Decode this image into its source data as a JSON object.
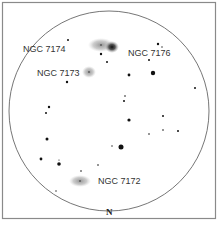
{
  "finder_chart": {
    "orientation_label": "N",
    "galaxies": [
      {
        "name": "NGC 7174",
        "label_x": 23,
        "label_y": 52,
        "shape": {
          "cx": 101,
          "cy": 45,
          "rx": 13,
          "ry": 7
        }
      },
      {
        "name": "NGC 7176",
        "label_x": 128,
        "label_y": 56,
        "shape": {
          "cx": 112,
          "cy": 47,
          "rx": 7,
          "ry": 6
        }
      },
      {
        "name": "NGC 7173",
        "label_x": 37,
        "label_y": 76,
        "shape": {
          "cx": 89,
          "cy": 72,
          "rx": 7,
          "ry": 6
        }
      },
      {
        "name": "NGC 7172",
        "label_x": 98,
        "label_y": 184,
        "shape": {
          "cx": 80,
          "cy": 181,
          "rx": 11,
          "ry": 6
        }
      }
    ],
    "stars": [
      {
        "x": 68,
        "y": 40,
        "r": 1
      },
      {
        "x": 101,
        "y": 54,
        "r": 1.2
      },
      {
        "x": 107,
        "y": 62,
        "r": 1
      },
      {
        "x": 158,
        "y": 44,
        "r": 1.2
      },
      {
        "x": 162,
        "y": 47,
        "r": 0.7
      },
      {
        "x": 149,
        "y": 60,
        "r": 1
      },
      {
        "x": 129,
        "y": 75,
        "r": 1.4
      },
      {
        "x": 153,
        "y": 73,
        "r": 2.2
      },
      {
        "x": 67,
        "y": 82,
        "r": 1.2
      },
      {
        "x": 195,
        "y": 88,
        "r": 1
      },
      {
        "x": 125,
        "y": 96,
        "r": 0.8
      },
      {
        "x": 124,
        "y": 101,
        "r": 1
      },
      {
        "x": 49,
        "y": 107,
        "r": 1.2
      },
      {
        "x": 46,
        "y": 113,
        "r": 1
      },
      {
        "x": 129,
        "y": 120,
        "r": 1.6
      },
      {
        "x": 163,
        "y": 116,
        "r": 1
      },
      {
        "x": 149,
        "y": 134,
        "r": 0.8
      },
      {
        "x": 163,
        "y": 130,
        "r": 0.8
      },
      {
        "x": 178,
        "y": 131,
        "r": 1
      },
      {
        "x": 47,
        "y": 139,
        "r": 1.5
      },
      {
        "x": 112,
        "y": 146,
        "r": 0.7
      },
      {
        "x": 121,
        "y": 147,
        "r": 2.5
      },
      {
        "x": 41,
        "y": 159,
        "r": 1.4
      },
      {
        "x": 59,
        "y": 160,
        "r": 0.6
      },
      {
        "x": 59,
        "y": 164,
        "r": 1.8
      },
      {
        "x": 98,
        "y": 165,
        "r": 0.8
      },
      {
        "x": 81,
        "y": 171,
        "r": 0.8
      },
      {
        "x": 56,
        "y": 191,
        "r": 0.7
      }
    ],
    "colors": {
      "frame": "#888888",
      "circle": "#666666",
      "star": "#111111",
      "galaxy": "#9a9a9a",
      "galaxy_core": "#222222"
    }
  }
}
